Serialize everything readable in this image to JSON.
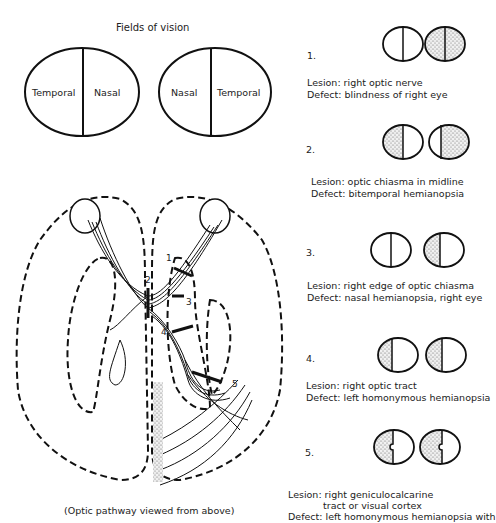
{
  "fields": {
    "title": "Fields of vision",
    "left_eye": {
      "left_label": "Temporal",
      "right_label": "Nasal"
    },
    "right_eye": {
      "left_label": "Nasal",
      "right_label": "Temporal"
    }
  },
  "pathway": {
    "caption": "(Optic pathway viewed from above)",
    "markers": [
      "1",
      "2",
      "3",
      "4",
      "5"
    ]
  },
  "cases": [
    {
      "number": "1.",
      "lesion": "Lesion: right optic nerve",
      "defect": "Defect: blindness of right eye",
      "left_field": "none",
      "right_field": "full"
    },
    {
      "number": "2.",
      "lesion": "Lesion: optic chiasma in midline",
      "defect": "Defect: bitemporal hemianopsia",
      "left_field": "left-half",
      "right_field": "right-half"
    },
    {
      "number": "3.",
      "lesion": "Lesion: right edge of optic chiasma",
      "defect": "Defect: nasal hemianopsia, right eye",
      "left_field": "none",
      "right_field": "left-half"
    },
    {
      "number": "4.",
      "lesion": "Lesion: right optic tract",
      "defect": "Defect: left homonymous hemianopsia",
      "left_field": "left-half",
      "right_field": "left-half"
    },
    {
      "number": "5.",
      "lesion": "Lesion:  right geniculocalcarine",
      "lesion_line2": "tract or visual cortex",
      "defect": "Defect: left homonymous hemianopsia with",
      "left_field": "left-half-macular-sparing",
      "right_field": "left-half-macular-sparing"
    }
  ]
}
